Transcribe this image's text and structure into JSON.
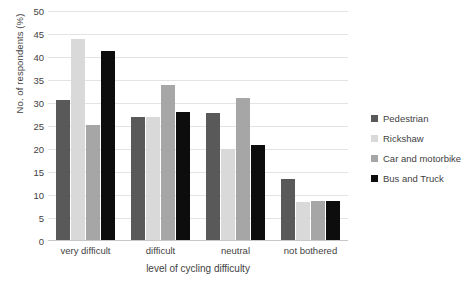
{
  "chart_data": {
    "type": "bar",
    "title": "",
    "xlabel": "level of cycling difficulty",
    "ylabel": "No. of respondents (%)",
    "categories": [
      "very difficult",
      "difficult",
      "neutral",
      "not bothered"
    ],
    "series": [
      {
        "name": "Pedestrian",
        "color": "#595959",
        "values": [
          30.6,
          27.0,
          27.8,
          13.5
        ]
      },
      {
        "name": "Rickshaw",
        "color": "#d9d9d9",
        "values": [
          44.0,
          27.0,
          20.0,
          8.5
        ]
      },
      {
        "name": "Car and motorbike",
        "color": "#a6a6a6",
        "values": [
          25.2,
          34.0,
          31.0,
          8.6
        ]
      },
      {
        "name": "Bus and Truck",
        "color": "#0d0d0d",
        "values": [
          41.4,
          28.0,
          20.9,
          8.7
        ]
      }
    ],
    "ylim": [
      0,
      50
    ],
    "ytick_step": 5,
    "yticks": [
      "50",
      "45",
      "40",
      "35",
      "30",
      "25",
      "20",
      "15",
      "10",
      "5",
      "0"
    ],
    "grid": true,
    "grid_color": "#e3e3e3",
    "legend_position": "right",
    "axis_text_color": "#3f3f3f",
    "background": "#ffffff"
  }
}
